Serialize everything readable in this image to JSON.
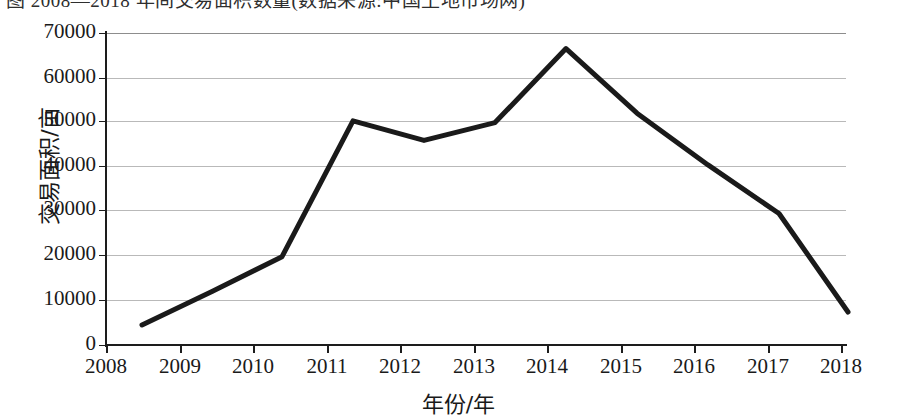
{
  "caption": "图 2008—2018 年间交易面积数量(数据来源:中国土地市场网)",
  "chart_data": {
    "type": "line",
    "title": "",
    "xlabel": "年份/年",
    "ylabel": "交易面积/亩",
    "x_tick_labels": [
      "2008",
      "2009",
      "2010",
      "2011",
      "2012",
      "2013",
      "2014",
      "2015",
      "2016",
      "2017",
      "2018"
    ],
    "y_tick_labels": [
      "0",
      "10000",
      "20000",
      "30000",
      "40000",
      "50000",
      "60000",
      "70000"
    ],
    "y_tick_values": [
      0,
      10000,
      20000,
      30000,
      40000,
      50000,
      60000,
      70000
    ],
    "ylim": [
      0,
      70000
    ],
    "xlim": [
      2008,
      2018
    ],
    "grid": true,
    "legend": "none",
    "line_color": "#1a1a1a",
    "line_width": 5,
    "markers": "none",
    "categories": [
      "2008",
      "2009",
      "2010",
      "2011",
      "2012",
      "2013",
      "2014",
      "2015",
      "2016",
      "2017",
      "2018"
    ],
    "values": [
      4500,
      12000,
      19800,
      50300,
      45900,
      49900,
      66500,
      52000,
      40400,
      29500,
      7400
    ],
    "series": [
      {
        "name": "交易面积",
        "values": [
          4500,
          12000,
          19800,
          50300,
          45900,
          49900,
          66500,
          52000,
          40400,
          29500,
          7400
        ]
      }
    ],
    "points_px": [
      {
        "x": 142,
        "y": 322
      },
      {
        "x": 212,
        "y": 288
      },
      {
        "x": 282,
        "y": 255
      },
      {
        "x": 353,
        "y": 119
      },
      {
        "x": 424,
        "y": 140
      },
      {
        "x": 495,
        "y": 121
      },
      {
        "x": 566,
        "y": 48
      },
      {
        "x": 637,
        "y": 113
      },
      {
        "x": 708,
        "y": 165
      },
      {
        "x": 779,
        "y": 216
      },
      {
        "x": 848,
        "y": 312
      }
    ]
  },
  "axis_geometry": {
    "plot_left": 106,
    "plot_right": 846,
    "plot_top": 33,
    "plot_bottom": 345,
    "x_tick_px": [
      106,
      180,
      253,
      327,
      400,
      474,
      547,
      621,
      694,
      768,
      841
    ],
    "y_tick_px": [
      345,
      300,
      255,
      210,
      166,
      121,
      78,
      33
    ]
  }
}
